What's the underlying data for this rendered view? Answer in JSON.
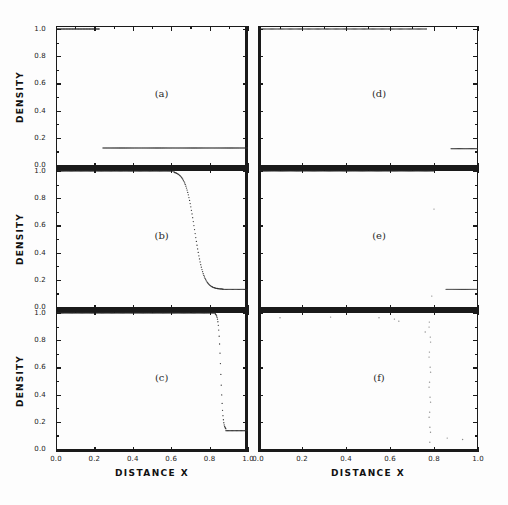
{
  "figure": {
    "axis_titles": {
      "x": "DISTANCE X",
      "y": "DENSITY"
    },
    "xticks": [
      "0.0",
      "0.2",
      "0.4",
      "0.6",
      "0.8",
      "1.0"
    ],
    "yticks": [
      "0.0",
      "0.2",
      "0.4",
      "0.6",
      "0.8",
      "1.0"
    ],
    "panel_labels": {
      "a": "(a)",
      "b": "(b)",
      "c": "(c)",
      "d": "(d)",
      "e": "(e)",
      "f": "(f)"
    },
    "ink_color": "#1a1a1a",
    "marker_color": "#2b2b2b"
  },
  "chart_data": [
    {
      "type": "scatter",
      "panel": "a",
      "title": "(a)",
      "xlabel": "DISTANCE X",
      "ylabel": "DENSITY",
      "xlim": [
        0.0,
        1.0
      ],
      "ylim": [
        0.0,
        1.0
      ],
      "grid": false,
      "legend": "none",
      "description": "High density plateau at 1.0 ending near x=0.22; low density plateau at 0.125 from x=0.24 to right edge; no plotted points in the transition gap.",
      "segments": [
        {
          "name": "upper-plateau",
          "x_start": 0.005,
          "x_end": 0.225,
          "y_start": 1.0,
          "y_end": 1.0,
          "n": 58
        },
        {
          "name": "lower-plateau",
          "x_start": 0.245,
          "x_end": 1.0,
          "y_start": 0.125,
          "y_end": 0.125,
          "n": 150
        }
      ]
    },
    {
      "type": "scatter",
      "panel": "b",
      "title": "(b)",
      "xlabel": "DISTANCE X",
      "ylabel": "DENSITY",
      "xlim": [
        0.0,
        1.0
      ],
      "ylim": [
        0.0,
        1.0
      ],
      "grid": false,
      "legend": "none",
      "description": "Plateau at 1.0 to x=0.62, then a smooth sigmoidal decay crossing 0.5 near x=0.72, settling onto 0.13 by x=0.85.",
      "segments": [
        {
          "name": "upper-plateau",
          "x_start": 0.005,
          "x_end": 0.615,
          "y_start": 1.0,
          "y_end": 1.0,
          "n": 130
        },
        {
          "name": "sigmoid-decay",
          "kind": "sigmoid",
          "x_start": 0.615,
          "x_end": 0.87,
          "y_high": 1.0,
          "y_low": 0.13,
          "x_mid": 0.722,
          "steepness": 42,
          "n": 80
        },
        {
          "name": "lower-plateau",
          "x_start": 0.87,
          "x_end": 1.0,
          "y_start": 0.13,
          "y_end": 0.13,
          "n": 30
        }
      ]
    },
    {
      "type": "scatter",
      "panel": "c",
      "title": "(c)",
      "xlabel": "DISTANCE X",
      "ylabel": "DENSITY",
      "xlim": [
        0.0,
        1.0
      ],
      "ylim": [
        0.0,
        1.0
      ],
      "grid": false,
      "legend": "none",
      "description": "Plateau at 1.0 to x=0.83, then a very sharp near-vertical drop between x=0.84 and x=0.88 down to 0.13, followed by a flat 0.13 plateau to the right edge.",
      "segments": [
        {
          "name": "upper-plateau",
          "x_start": 0.005,
          "x_end": 0.83,
          "y_start": 1.0,
          "y_end": 1.0,
          "n": 175
        },
        {
          "name": "sigmoid-decay",
          "kind": "sigmoid",
          "x_start": 0.83,
          "x_end": 0.885,
          "y_high": 1.0,
          "y_low": 0.14,
          "x_mid": 0.858,
          "steepness": 170,
          "n": 26
        },
        {
          "name": "lower-plateau",
          "x_start": 0.885,
          "x_end": 1.0,
          "y_start": 0.135,
          "y_end": 0.135,
          "n": 28
        }
      ]
    },
    {
      "type": "scatter",
      "panel": "d",
      "title": "(d)",
      "xlabel": "DISTANCE X",
      "ylabel": "DENSITY",
      "xlim": [
        0.0,
        1.0
      ],
      "ylim": [
        0.0,
        1.0
      ],
      "grid": false,
      "legend": "none",
      "description": "Plateau at 1.0 from the left edge to roughly x=0.76 with slight thinning of points near its end; low plateau at 0.12 from x=0.88 to the right edge; empty transition region.",
      "segments": [
        {
          "name": "upper-plateau",
          "x_start": 0.005,
          "x_end": 0.765,
          "y_start": 1.0,
          "y_end": 1.0,
          "n": 150
        },
        {
          "name": "lower-plateau",
          "x_start": 0.878,
          "x_end": 1.0,
          "y_start": 0.12,
          "y_end": 0.12,
          "n": 30
        }
      ]
    },
    {
      "type": "scatter",
      "panel": "e",
      "title": "(e)",
      "xlabel": "DISTANCE X",
      "ylabel": "DENSITY",
      "xlim": [
        0.0,
        1.0
      ],
      "ylim": [
        0.0,
        1.0
      ],
      "grid": false,
      "legend": "none",
      "description": "Dense plateau at 1.0 from the left edge to about x=0.80; low plateau at 0.13 from x=0.855 to the right edge; a couple of isolated stray points in the interior.",
      "segments": [
        {
          "name": "upper-plateau",
          "x_start": 0.005,
          "x_end": 0.8,
          "y_start": 1.0,
          "y_end": 1.0,
          "n": 165
        },
        {
          "name": "lower-plateau",
          "x_start": 0.855,
          "x_end": 1.0,
          "y_start": 0.13,
          "y_end": 0.13,
          "n": 34
        }
      ],
      "stray_points": [
        {
          "x": 0.14,
          "y": 1.05
        },
        {
          "x": 0.8,
          "y": 0.72
        },
        {
          "x": 0.79,
          "y": 0.08
        }
      ]
    },
    {
      "type": "scatter",
      "panel": "f",
      "title": "(f)",
      "xlabel": "DISTANCE X",
      "ylabel": "DENSITY",
      "xlim": [
        0.0,
        1.0
      ],
      "ylim": [
        0.0,
        1.0
      ],
      "grid": false,
      "legend": "none",
      "description": "Almost empty panel: a faint near-vertical column of sparse points around x=0.78 spanning most of the vertical range, plus scattered isolated dots near the top.",
      "segments": [
        {
          "name": "vertical-column",
          "kind": "vertical",
          "x": 0.781,
          "y_start": 0.05,
          "y_end": 0.97,
          "n": 26,
          "sparse": true
        }
      ],
      "stray_points": [
        {
          "x": 0.1,
          "y": 0.965
        },
        {
          "x": 0.33,
          "y": 0.97
        },
        {
          "x": 0.55,
          "y": 0.965
        },
        {
          "x": 0.62,
          "y": 0.955
        },
        {
          "x": 0.64,
          "y": 0.94
        },
        {
          "x": 0.76,
          "y": 0.86
        },
        {
          "x": 0.86,
          "y": 0.08
        },
        {
          "x": 0.93,
          "y": 0.07
        }
      ]
    }
  ]
}
